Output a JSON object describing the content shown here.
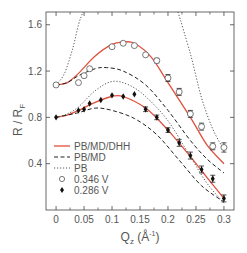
{
  "chart_data": {
    "type": "line",
    "title": "",
    "xlabel": "Q_z (Å⁻¹)",
    "xlabel_main": "Q",
    "xlabel_sub": "z",
    "xlabel_unit": " (Å",
    "xlabel_sup": "-1",
    "xlabel_close": ")",
    "ylabel": "R / R_F",
    "ylabel_main": "R / R",
    "ylabel_sub": "F",
    "xlim": [
      -0.018,
      0.318
    ],
    "ylim": [
      0.0,
      1.71
    ],
    "xticks": [
      0,
      0.05,
      0.1,
      0.15,
      0.2,
      0.25,
      0.3
    ],
    "xtick_labels": [
      "0",
      "0.05",
      "0.1",
      "0.15",
      "0.2",
      "0.25",
      "0.3"
    ],
    "yticks": [
      0.4,
      0.8,
      1.2,
      1.6
    ],
    "ytick_labels": [
      "0.4",
      "0.8",
      "1.2",
      "1.6"
    ],
    "grid": false,
    "legend_position": "lower left",
    "legend": [
      {
        "label": "PB/MD/DHH",
        "style": "solid",
        "color": "#e0503c"
      },
      {
        "label": "PB/MD",
        "style": "dashed",
        "color": "#222222"
      },
      {
        "label": "PB",
        "style": "dotted",
        "color": "#555555"
      },
      {
        "label": "0.346 V",
        "style": "open-circle",
        "color": "#555555"
      },
      {
        "label": "0.286 V",
        "style": "filled-diamond",
        "color": "#111111"
      }
    ],
    "series": [
      {
        "name": "0.346 V",
        "kind": "markers",
        "marker": "open-circle",
        "x": [
          0.0,
          0.04,
          0.05,
          0.06,
          0.1,
          0.12,
          0.14,
          0.16,
          0.18,
          0.2,
          0.22,
          0.24,
          0.26,
          0.28,
          0.3
        ],
        "y": [
          1.08,
          1.1,
          1.16,
          1.22,
          1.41,
          1.44,
          1.42,
          1.34,
          1.29,
          1.14,
          1.02,
          0.83,
          0.72,
          0.55,
          0.54
        ],
        "err": [
          0,
          0,
          0,
          0,
          0,
          0,
          0,
          0,
          0.02,
          0.03,
          0.03,
          0.03,
          0.03,
          0.03,
          0.04
        ]
      },
      {
        "name": "0.286 V",
        "kind": "markers",
        "marker": "filled-diamond",
        "x": [
          0.0,
          0.04,
          0.05,
          0.06,
          0.08,
          0.1,
          0.12,
          0.14,
          0.16,
          0.18,
          0.2,
          0.22,
          0.24,
          0.26,
          0.28,
          0.3
        ],
        "y": [
          0.8,
          0.86,
          0.87,
          0.92,
          0.95,
          0.99,
          0.98,
          1.0,
          0.87,
          0.8,
          0.69,
          0.58,
          0.47,
          0.35,
          0.27,
          0.1
        ],
        "err": [
          0,
          0,
          0,
          0,
          0,
          0,
          0,
          0,
          0.02,
          0.02,
          0.02,
          0.03,
          0.03,
          0.03,
          0.03,
          0.03
        ]
      },
      {
        "name": "PB/MD/DHH (0.346 V)",
        "kind": "line",
        "style": "solid",
        "color": "#e0503c",
        "x": [
          0.0,
          0.02,
          0.04,
          0.07,
          0.1,
          0.12,
          0.14,
          0.17,
          0.2,
          0.24,
          0.27,
          0.3
        ],
        "y": [
          1.08,
          1.1,
          1.18,
          1.33,
          1.43,
          1.45,
          1.44,
          1.32,
          1.1,
          0.8,
          0.56,
          0.4
        ]
      },
      {
        "name": "PB/MD (0.346 V)",
        "kind": "line",
        "style": "dashed",
        "color": "#222222",
        "x": [
          0.0,
          0.02,
          0.04,
          0.07,
          0.09,
          0.12,
          0.16,
          0.2,
          0.24,
          0.27,
          0.3
        ],
        "y": [
          1.08,
          1.1,
          1.16,
          1.22,
          1.23,
          1.2,
          1.08,
          0.86,
          0.6,
          0.44,
          0.32
        ]
      },
      {
        "name": "PB (0.346 V)",
        "kind": "line",
        "style": "dotted",
        "color": "#555555",
        "x": [
          0.0,
          0.015,
          0.03,
          0.04,
          0.048
        ],
        "y": [
          1.08,
          1.18,
          1.4,
          1.6,
          1.71
        ],
        "x2": [
          0.218,
          0.24,
          0.26,
          0.28,
          0.3
        ],
        "y2": [
          1.71,
          1.35,
          0.97,
          0.7,
          0.52
        ]
      },
      {
        "name": "PB/MD/DHH (0.286 V)",
        "kind": "line",
        "style": "solid",
        "color": "#e0503c",
        "x": [
          0.0,
          0.02,
          0.04,
          0.07,
          0.1,
          0.12,
          0.16,
          0.2,
          0.24,
          0.27,
          0.3
        ],
        "y": [
          0.8,
          0.82,
          0.86,
          0.93,
          0.98,
          0.98,
          0.88,
          0.69,
          0.46,
          0.28,
          0.1
        ]
      },
      {
        "name": "PB/MD (0.286 V)",
        "kind": "line",
        "style": "dashed",
        "color": "#222222",
        "x": [
          0.0,
          0.02,
          0.04,
          0.07,
          0.1,
          0.14,
          0.18,
          0.22,
          0.26,
          0.3
        ],
        "y": [
          0.8,
          0.82,
          0.84,
          0.88,
          0.86,
          0.79,
          0.65,
          0.43,
          0.21,
          0.07
        ]
      },
      {
        "name": "PB (0.286 V)",
        "kind": "line",
        "style": "dotted",
        "color": "#555555",
        "x": [
          0.0,
          0.02,
          0.04,
          0.07,
          0.1,
          0.13,
          0.16,
          0.2,
          0.24,
          0.27,
          0.3
        ],
        "y": [
          0.8,
          0.83,
          0.89,
          1.03,
          1.11,
          1.08,
          0.98,
          0.77,
          0.46,
          0.23,
          0.06
        ]
      }
    ]
  }
}
